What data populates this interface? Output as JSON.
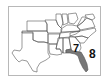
{
  "map": {
    "title": "",
    "region": "Southern United States",
    "highlighted_state": "Florida",
    "highlight_color": "#666666",
    "outline_color": "#555555",
    "labels": [
      {
        "id": "label-7",
        "text": "7"
      },
      {
        "id": "label-8",
        "text": "8"
      }
    ]
  }
}
